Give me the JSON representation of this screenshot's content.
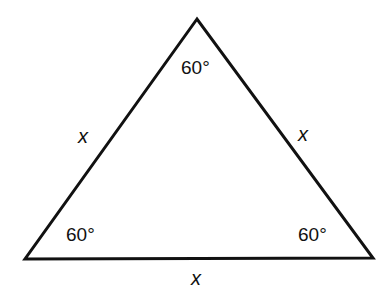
{
  "diagram": {
    "shape": "equilateral triangle",
    "stroke_color": "#111111",
    "vertices": {
      "top": [
        197,
        19
      ],
      "bottom_left": [
        25,
        259
      ],
      "bottom_right": [
        373,
        258
      ]
    },
    "angles": {
      "top": "60°",
      "bottom_left": "60°",
      "bottom_right": "60°"
    },
    "sides": {
      "left": "x",
      "right": "x",
      "bottom": "x"
    }
  }
}
